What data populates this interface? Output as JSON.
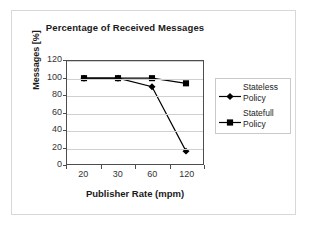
{
  "chart_data": {
    "type": "line",
    "title": "Percentage of Received Messages",
    "xlabel": "Publisher Rate (mpm)",
    "ylabel": "Messages [%]",
    "categories": [
      "20",
      "30",
      "60",
      "120"
    ],
    "ylim": [
      0,
      120
    ],
    "yticks": [
      "0",
      "20",
      "40",
      "60",
      "80",
      "100",
      "120"
    ],
    "grid": "horizontal",
    "legend_position": "right",
    "series": [
      {
        "name": "Stateless Policy",
        "name_line1": "Stateless",
        "name_line2": "Policy",
        "marker": "diamond",
        "color": "#000000",
        "values": [
          100,
          100,
          90,
          15
        ]
      },
      {
        "name": "Statefull Policy",
        "name_line1": "Statefull",
        "name_line2": "Policy",
        "marker": "square",
        "color": "#000000",
        "values": [
          100,
          100,
          100,
          94
        ]
      }
    ]
  }
}
